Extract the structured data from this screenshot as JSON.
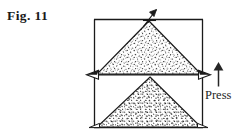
{
  "figure": {
    "label": "Fig. 11",
    "caption_position": "top-left",
    "press_label": "Press",
    "ink_color": "#1a1a1a",
    "background_color": "#ffffff"
  },
  "diagram": {
    "type": "mechanical-press-schematic",
    "box": {
      "left": 94,
      "top": 19,
      "right": 203,
      "bottom": 128,
      "divider_y": 75
    },
    "upper_cone": {
      "name": "fine-powder-cone",
      "apex": [
        149,
        21
      ],
      "base_left": [
        97,
        74
      ],
      "base_right": [
        201,
        74
      ],
      "fill_texture": "fine-stipple",
      "fill_density": 0.3
    },
    "lower_cone": {
      "name": "coarse-granular-cone",
      "apex": [
        150,
        77
      ],
      "base_left": [
        97,
        127
      ],
      "base_right": [
        201,
        127
      ],
      "fill_texture": "coarse-speckle",
      "fill_density": 0.75
    },
    "arrows": [
      {
        "name": "top-feed-arrow",
        "direction": "up-left",
        "x": 150,
        "y": 18
      },
      {
        "name": "left-platen-arrow",
        "direction": "left",
        "x": 95,
        "y": 74
      },
      {
        "name": "right-platen-arrow",
        "direction": "right",
        "x": 202,
        "y": 74
      },
      {
        "name": "press-direction-arrow",
        "direction": "up",
        "x": 218,
        "y_top": 63,
        "y_bottom": 86
      }
    ]
  }
}
